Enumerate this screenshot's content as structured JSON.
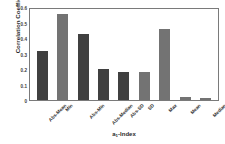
{
  "chart_data": {
    "type": "bar",
    "title": "",
    "xlabel": "a₁-Index",
    "xlabel_base": "a",
    "xlabel_sub": "1",
    "xlabel_rest": "-Index",
    "ylabel": "Correlation Coefficient",
    "categories": [
      "Abs-Mean",
      "Min",
      "Abs-Min",
      "Abs-Median",
      "Abs-SD",
      "SD",
      "Max",
      "Mean",
      "Median"
    ],
    "values": [
      0.315,
      0.555,
      0.425,
      0.2,
      0.18,
      0.18,
      0.46,
      0.02,
      0.015
    ],
    "bar_colors": [
      "#404040",
      "#737373",
      "#404040",
      "#404040",
      "#404040",
      "#737373",
      "#737373",
      "#737373",
      "#737373"
    ],
    "ylim": [
      0,
      0.6
    ],
    "yticks": [
      0,
      0.1,
      0.2,
      0.3,
      0.4,
      0.5,
      0.6
    ],
    "ytick_labels": [
      "0",
      "0.1",
      "0.2",
      "0.3",
      "0.4",
      "0.5",
      "0.6"
    ],
    "grid": false,
    "legend": "none",
    "frame_color": "#7a7a7a",
    "background": "#ffffff"
  }
}
